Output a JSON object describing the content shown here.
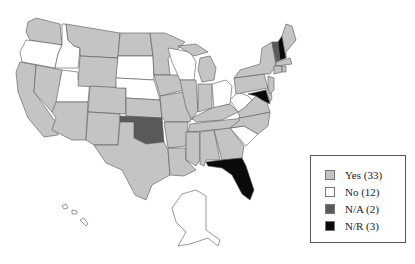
{
  "title_fragment": "",
  "legend": {
    "items": [
      {
        "key": "yes",
        "label": "Yes (33)",
        "color": "#c4c4c4"
      },
      {
        "key": "no",
        "label": "No (12)",
        "color": "#ffffff"
      },
      {
        "key": "na",
        "label": "N/A (2)",
        "color": "#5a5a5a"
      },
      {
        "key": "nr",
        "label": "N/R (3)",
        "color": "#0a0a0a"
      }
    ]
  },
  "map": {
    "states": {
      "WA": "yes",
      "OR": "no",
      "CA": "yes",
      "NV": "yes",
      "ID": "no",
      "UT": "no",
      "AZ": "yes",
      "MT": "yes",
      "WY": "yes",
      "CO": "yes",
      "NM": "yes",
      "ND": "yes",
      "SD": "no",
      "NE": "no",
      "KS": "yes",
      "OK": "na",
      "TX": "yes",
      "MN": "yes",
      "IA": "yes",
      "MO": "yes",
      "AR": "yes",
      "LA": "yes",
      "WI": "no",
      "IL": "yes",
      "MI": "yes",
      "IN": "yes",
      "OH": "no",
      "KY": "yes",
      "TN": "yes",
      "MS": "yes",
      "AL": "yes",
      "GA": "yes",
      "FL": "nr",
      "SC": "no",
      "NC": "yes",
      "VA": "yes",
      "WV": "no",
      "PA": "yes",
      "NY": "yes",
      "VT": "na",
      "NH": "nr",
      "ME": "yes",
      "MA": "yes",
      "CT": "yes",
      "RI": "yes",
      "NJ": "yes",
      "DE": "yes",
      "MD": "nr",
      "AK": "no",
      "HI": "no"
    }
  }
}
